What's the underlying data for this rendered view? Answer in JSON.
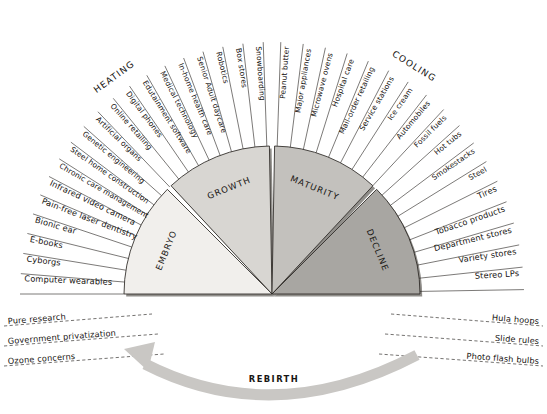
{
  "diagram": {
    "center": {
      "x": 272,
      "y": 294
    },
    "phases": [
      {
        "key": "embryo",
        "label": "EMBRYO",
        "fill": "#f1efec",
        "start_deg": 180,
        "end_deg": 135
      },
      {
        "key": "growth",
        "label": "GROWTH",
        "fill": "#d8d6d2",
        "start_deg": 133,
        "end_deg": 91
      },
      {
        "key": "maturity",
        "label": "MATURITY",
        "fill": "#c3c1bd",
        "start_deg": 89,
        "end_deg": 47
      },
      {
        "key": "decline",
        "label": "DECLINE",
        "fill": "#a8a6a2",
        "start_deg": 45,
        "end_deg": 0
      }
    ],
    "markers": [
      {
        "key": "heating",
        "label": "HEATING"
      },
      {
        "key": "cooling",
        "label": "COOLING"
      }
    ],
    "rebirth": {
      "label": "REBIRTH",
      "arrow_color": "#c9c7c4"
    },
    "left_labels": [
      "Computer wearables",
      "Cyborgs",
      "E-books",
      "Bionic ear",
      "Pain-free laser dentistry",
      "Infrared video camera",
      "Chronic care management",
      "Steel home construction",
      "Genetic engineering",
      "Artificial organs",
      "Online retailing",
      "Digital phones",
      "Edutainment software",
      "Medical technology",
      "In-home health care",
      "Senior Adult daycare",
      "Robotics",
      "Box stores",
      "Snowboarding"
    ],
    "right_labels": [
      "Peanut butter",
      "Major appliances",
      "Microwave ovens",
      "Hospital care",
      "Mail-order retailing",
      "Service stations",
      "Ice cream",
      "Automobiles",
      "Fossil fuels",
      "Hot tubs",
      "Smokestacks",
      "Steel",
      "Tires",
      "Tobacco products",
      "Department stores",
      "Variety stores",
      "Stereo LPs"
    ],
    "bottom_left_labels": [
      "Pure research",
      "Government privatization",
      "Ozone concerns"
    ],
    "bottom_right_labels": [
      "Hula hoops",
      "Slide rules",
      "Photo flash bulbs"
    ]
  },
  "chart_data": {
    "type": "pie",
    "legend_position": "none",
    "categories": [
      "EMBRYO",
      "GROWTH",
      "MATURITY",
      "DECLINE"
    ],
    "values": [
      45,
      42,
      42,
      45
    ],
    "annotations": [
      "HEATING",
      "COOLING",
      "REBIRTH"
    ]
  }
}
